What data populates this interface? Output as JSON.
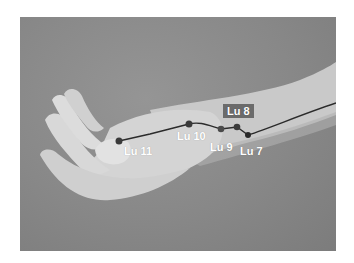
{
  "figure": {
    "background_color": "#8a8a8a",
    "line_color": "#2b2b2b",
    "point_color": "#3a3a3a",
    "label_color": "#ffffff",
    "label_box_color": "#6b6b6b"
  },
  "points": [
    {
      "id": "lu11",
      "label": "Lu 11",
      "x": 119,
      "y": 141
    },
    {
      "id": "lu10",
      "label": "Lu 10",
      "x": 189,
      "y": 124
    },
    {
      "id": "lu9",
      "label": "Lu 9",
      "x": 221,
      "y": 129
    },
    {
      "id": "lu8",
      "label": "Lu 8",
      "x": 237,
      "y": 127
    },
    {
      "id": "lu7",
      "label": "Lu 7",
      "x": 248,
      "y": 135
    }
  ]
}
